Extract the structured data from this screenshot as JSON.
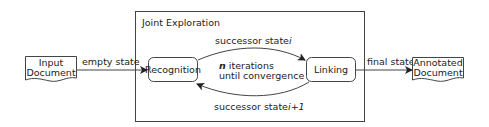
{
  "diagram": {
    "group": {
      "title": "Joint Exploration"
    },
    "nodes": {
      "input": {
        "line1": "Input",
        "line2": "Document",
        "shape": "document"
      },
      "recognition": {
        "label": "Recognition",
        "shape": "rounded-rect"
      },
      "linking": {
        "label": "Linking",
        "shape": "rounded-rect"
      },
      "output": {
        "line1": "Annotated",
        "line2": "Document",
        "shape": "document"
      }
    },
    "edges": {
      "input_to_recognition": {
        "label": "empty state"
      },
      "recognition_to_linking": {
        "label": "successor state",
        "var": "i"
      },
      "linking_to_recognition": {
        "label": "successor state",
        "var": "i+1"
      },
      "linking_to_output": {
        "label": "final state"
      }
    },
    "loop_note": {
      "var": "n",
      "line1_rest": " iterations",
      "line2": "until convergence"
    }
  }
}
